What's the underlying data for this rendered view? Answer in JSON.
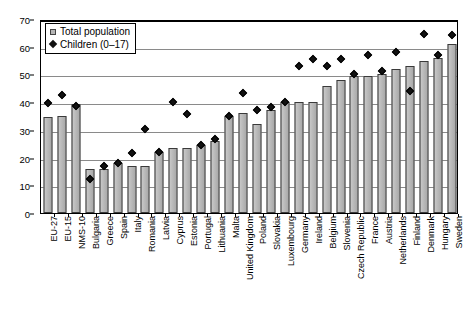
{
  "chart_data": {
    "type": "bar",
    "title": "",
    "xlabel": "",
    "ylabel": "",
    "ylim": [
      0,
      70
    ],
    "yticks": [
      0,
      10,
      20,
      30,
      40,
      50,
      60,
      70
    ],
    "grid": true,
    "legend_position": "top-left",
    "categories": [
      "EU-27",
      "EU-15",
      "NMS-10",
      "Bulgaria",
      "Greece",
      "Spain",
      "Italy",
      "Romania",
      "Latvia",
      "Cyprus",
      "Estonia",
      "Portugal",
      "Lithuania",
      "Malta",
      "United Kingdom",
      "Poland",
      "Slovakia",
      "Luxembourg",
      "Germany",
      "Ireland",
      "Belgium",
      "Slovenia",
      "Czech Republic",
      "France",
      "Austria",
      "Netherlands",
      "Finland",
      "Denmark",
      "Hungary",
      "Sweden"
    ],
    "series": [
      {
        "name": "Total population",
        "marker": "bar",
        "color": "#b5b5b5",
        "values": [
          34.5,
          35.0,
          39.5,
          16.0,
          16.0,
          18.0,
          17.0,
          17.0,
          22.0,
          23.5,
          23.5,
          24.5,
          26.0,
          35.0,
          36.0,
          32.0,
          37.0,
          40.0,
          40.0,
          40.0,
          46.0,
          48.0,
          49.5,
          49.5,
          50.0,
          52.0,
          53.0,
          55.0,
          56.0,
          61.0
        ]
      },
      {
        "name": "Children (0–17)",
        "marker": "diamond",
        "color": "#111111",
        "values": [
          39.5,
          42.5,
          38.5,
          12.0,
          17.0,
          18.0,
          21.5,
          30.0,
          22.0,
          40.0,
          35.5,
          24.5,
          26.5,
          35.0,
          43.0,
          37.0,
          38.0,
          40.0,
          53.0,
          55.5,
          53.0,
          55.5,
          50.0,
          57.0,
          51.0,
          58.0,
          44.0,
          64.5,
          57.0,
          64.0
        ]
      }
    ]
  },
  "legend": {
    "items": [
      {
        "label": "Total population",
        "icon": "grey-square-icon"
      },
      {
        "label": "Children (0–17)",
        "icon": "black-diamond-icon"
      }
    ]
  }
}
